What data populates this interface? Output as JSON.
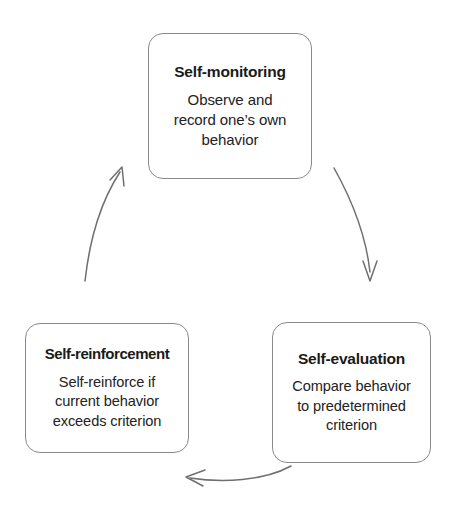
{
  "diagram": {
    "background_color": "#ffffff",
    "box_border_color": "#8a8a8a",
    "arrow_color": "#6f6f6f",
    "text_color": "#1a1a1a",
    "nodes": [
      {
        "id": "self-monitoring",
        "title": "Self-monitoring",
        "body": "Observe and\nrecord one’s own\nbehavior"
      },
      {
        "id": "self-evaluation",
        "title": "Self-evaluation",
        "body": "Compare behavior\nto predetermined\ncriterion"
      },
      {
        "id": "self-reinforcement",
        "title": "Self-reinforcement",
        "body": "Self-reinforce if\ncurrent behavior\nexceeds criterion"
      }
    ],
    "arrows": [
      {
        "id": "arrow-monitoring-to-evaluation",
        "from": "self-monitoring",
        "to": "self-evaluation",
        "direction": "down-right"
      },
      {
        "id": "arrow-evaluation-to-reinforcement",
        "from": "self-evaluation",
        "to": "self-reinforcement",
        "direction": "right-to-left"
      },
      {
        "id": "arrow-reinforcement-to-monitoring",
        "from": "self-reinforcement",
        "to": "self-monitoring",
        "direction": "up-right"
      }
    ]
  }
}
